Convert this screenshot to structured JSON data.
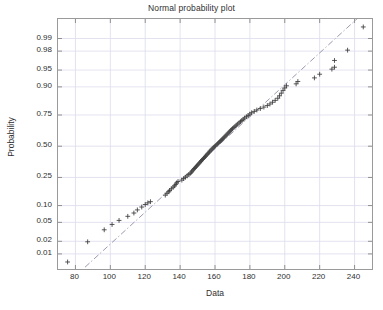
{
  "chart_data": {
    "type": "scatter",
    "title": "Normal probability plot",
    "xlabel": "Data",
    "ylabel": "Probability",
    "grid": true,
    "legend": null,
    "xlim": [
      70,
      250
    ],
    "xticks": [
      80,
      100,
      120,
      140,
      160,
      180,
      200,
      220,
      240
    ],
    "xticklabels": [
      "80",
      "100",
      "120",
      "140",
      "160",
      "180",
      "200",
      "220",
      "240"
    ],
    "yscale": "probit",
    "ylim_prob": [
      0.004,
      0.997
    ],
    "yticks": [
      0.01,
      0.02,
      0.05,
      0.1,
      0.25,
      0.5,
      0.75,
      0.9,
      0.95,
      0.98,
      0.99
    ],
    "yticklabels": [
      "0.01",
      "0.02",
      "0.05",
      "0.10",
      "0.25",
      "0.50",
      "0.75",
      "0.90",
      "0.95",
      "0.98",
      "0.99"
    ],
    "marker": "+",
    "marker_color": "#3c3c3c",
    "reference_line": {
      "style": "dash-dot",
      "color": "#8f8fa8",
      "x": [
        85.5,
        243.0
      ],
      "prob": [
        0.0045,
        0.9975
      ]
    },
    "points": [
      {
        "x": 75.5,
        "p": 0.0062
      },
      {
        "x": 87.0,
        "p": 0.0195
      },
      {
        "x": 96.5,
        "p": 0.0355
      },
      {
        "x": 101.0,
        "p": 0.0455
      },
      {
        "x": 105.0,
        "p": 0.0545
      },
      {
        "x": 110.0,
        "p": 0.065
      },
      {
        "x": 113.5,
        "p": 0.0745
      },
      {
        "x": 115.5,
        "p": 0.0845
      },
      {
        "x": 118.0,
        "p": 0.0945
      },
      {
        "x": 120.0,
        "p": 0.104
      },
      {
        "x": 121.5,
        "p": 0.1105
      },
      {
        "x": 123.0,
        "p": 0.1155
      },
      {
        "x": 131.5,
        "p": 0.1455
      },
      {
        "x": 132.5,
        "p": 0.1545
      },
      {
        "x": 133.5,
        "p": 0.1625
      },
      {
        "x": 134.0,
        "p": 0.17
      },
      {
        "x": 135.0,
        "p": 0.179
      },
      {
        "x": 136.0,
        "p": 0.188
      },
      {
        "x": 136.8,
        "p": 0.196
      },
      {
        "x": 137.5,
        "p": 0.205
      },
      {
        "x": 138.0,
        "p": 0.214
      },
      {
        "x": 138.8,
        "p": 0.223
      },
      {
        "x": 141.0,
        "p": 0.232
      },
      {
        "x": 142.0,
        "p": 0.242
      },
      {
        "x": 143.0,
        "p": 0.251
      },
      {
        "x": 144.0,
        "p": 0.2605
      },
      {
        "x": 145.0,
        "p": 0.27
      },
      {
        "x": 145.8,
        "p": 0.279
      },
      {
        "x": 146.5,
        "p": 0.288
      },
      {
        "x": 147.0,
        "p": 0.297
      },
      {
        "x": 147.6,
        "p": 0.306
      },
      {
        "x": 148.2,
        "p": 0.315
      },
      {
        "x": 148.8,
        "p": 0.324
      },
      {
        "x": 149.4,
        "p": 0.333
      },
      {
        "x": 150.0,
        "p": 0.342
      },
      {
        "x": 150.6,
        "p": 0.351
      },
      {
        "x": 151.2,
        "p": 0.36
      },
      {
        "x": 151.8,
        "p": 0.369
      },
      {
        "x": 152.2,
        "p": 0.378
      },
      {
        "x": 152.8,
        "p": 0.387
      },
      {
        "x": 153.4,
        "p": 0.396
      },
      {
        "x": 154.0,
        "p": 0.405
      },
      {
        "x": 154.6,
        "p": 0.414
      },
      {
        "x": 155.0,
        "p": 0.423
      },
      {
        "x": 155.6,
        "p": 0.432
      },
      {
        "x": 156.2,
        "p": 0.441
      },
      {
        "x": 156.8,
        "p": 0.45
      },
      {
        "x": 157.2,
        "p": 0.459
      },
      {
        "x": 157.8,
        "p": 0.468
      },
      {
        "x": 158.4,
        "p": 0.477
      },
      {
        "x": 159.0,
        "p": 0.486
      },
      {
        "x": 159.6,
        "p": 0.495
      },
      {
        "x": 160.2,
        "p": 0.504
      },
      {
        "x": 161.0,
        "p": 0.513
      },
      {
        "x": 161.6,
        "p": 0.522
      },
      {
        "x": 162.2,
        "p": 0.531
      },
      {
        "x": 162.8,
        "p": 0.54
      },
      {
        "x": 163.4,
        "p": 0.549
      },
      {
        "x": 164.0,
        "p": 0.558
      },
      {
        "x": 164.6,
        "p": 0.567
      },
      {
        "x": 165.2,
        "p": 0.576
      },
      {
        "x": 165.8,
        "p": 0.585
      },
      {
        "x": 166.4,
        "p": 0.594
      },
      {
        "x": 167.0,
        "p": 0.603
      },
      {
        "x": 167.6,
        "p": 0.612
      },
      {
        "x": 168.2,
        "p": 0.621
      },
      {
        "x": 168.8,
        "p": 0.63
      },
      {
        "x": 169.4,
        "p": 0.639
      },
      {
        "x": 170.0,
        "p": 0.648
      },
      {
        "x": 170.8,
        "p": 0.657
      },
      {
        "x": 171.5,
        "p": 0.666
      },
      {
        "x": 172.2,
        "p": 0.675
      },
      {
        "x": 173.0,
        "p": 0.684
      },
      {
        "x": 173.8,
        "p": 0.693
      },
      {
        "x": 174.6,
        "p": 0.702
      },
      {
        "x": 175.4,
        "p": 0.711
      },
      {
        "x": 176.2,
        "p": 0.72
      },
      {
        "x": 177.0,
        "p": 0.729
      },
      {
        "x": 178.0,
        "p": 0.738
      },
      {
        "x": 179.0,
        "p": 0.747
      },
      {
        "x": 180.0,
        "p": 0.756
      },
      {
        "x": 181.0,
        "p": 0.765
      },
      {
        "x": 182.5,
        "p": 0.774
      },
      {
        "x": 184.0,
        "p": 0.783
      },
      {
        "x": 186.0,
        "p": 0.792
      },
      {
        "x": 188.0,
        "p": 0.801
      },
      {
        "x": 190.0,
        "p": 0.81
      },
      {
        "x": 191.5,
        "p": 0.819
      },
      {
        "x": 193.0,
        "p": 0.829
      },
      {
        "x": 194.5,
        "p": 0.839
      },
      {
        "x": 196.0,
        "p": 0.85
      },
      {
        "x": 197.0,
        "p": 0.862
      },
      {
        "x": 198.0,
        "p": 0.874
      },
      {
        "x": 199.0,
        "p": 0.886
      },
      {
        "x": 200.0,
        "p": 0.896
      },
      {
        "x": 201.0,
        "p": 0.904
      },
      {
        "x": 206.5,
        "p": 0.911
      },
      {
        "x": 207.5,
        "p": 0.919
      },
      {
        "x": 217.0,
        "p": 0.93
      },
      {
        "x": 220.0,
        "p": 0.94
      },
      {
        "x": 227.0,
        "p": 0.952
      },
      {
        "x": 228.5,
        "p": 0.956
      },
      {
        "x": 228.5,
        "p": 0.968
      },
      {
        "x": 236.0,
        "p": 0.981
      },
      {
        "x": 245.0,
        "p": 0.995
      }
    ]
  }
}
